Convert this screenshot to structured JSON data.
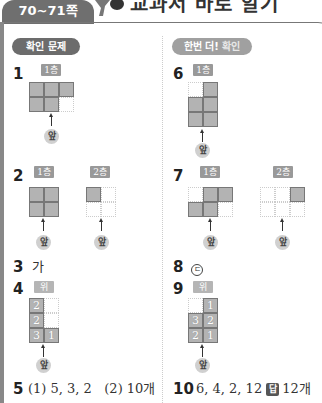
{
  "header": {
    "page_range": "70~71쪽",
    "title": "교과서 바로 알기"
  },
  "sections": {
    "left_badge": "확인 문제",
    "right_badge_main": "한번 더! ",
    "right_badge_accent": "확인"
  },
  "labels": {
    "floor1": "1층",
    "floor2": "2층",
    "top_view": "위",
    "front": "앞"
  },
  "problems": {
    "p1": {
      "num": "1",
      "floor1_grid": [
        [
          1,
          1,
          1
        ],
        [
          1,
          1,
          0
        ]
      ]
    },
    "p2": {
      "num": "2",
      "floor1_grid": [
        [
          1,
          1
        ],
        [
          1,
          1
        ]
      ],
      "floor2_grid": [
        [
          1,
          0
        ],
        [
          0,
          0
        ]
      ]
    },
    "p3": {
      "num": "3",
      "answer": "가"
    },
    "p4": {
      "num": "4",
      "top_grid": [
        [
          "2",
          ""
        ],
        [
          "2",
          ""
        ],
        [
          "3",
          "1"
        ]
      ]
    },
    "p5": {
      "num": "5",
      "answer_part1": "(1) 5, 3, 2",
      "answer_part2": "(2) 10개"
    },
    "p6": {
      "num": "6",
      "floor1_grid": [
        [
          0,
          1
        ],
        [
          1,
          1
        ],
        [
          1,
          1
        ]
      ]
    },
    "p7": {
      "num": "7",
      "floor1_grid": [
        [
          0,
          1,
          1
        ],
        [
          1,
          1,
          0
        ]
      ],
      "floor2_grid": [
        [
          0,
          0,
          1
        ],
        [
          0,
          0,
          0
        ]
      ]
    },
    "p8": {
      "num": "8",
      "answer": "ㄷ"
    },
    "p9": {
      "num": "9",
      "top_grid": [
        [
          "",
          "1"
        ],
        [
          "3",
          "2"
        ],
        [
          "2",
          "1"
        ]
      ]
    },
    "p10": {
      "num": "10",
      "answer_work": "6, 4, 2, 12",
      "answer_icon": "답",
      "answer_final": "12개"
    }
  },
  "colors": {
    "tab_bg": "#6f6f6f",
    "filled_cell": "#b3b3b3",
    "badge_left": "#6c6c6c",
    "badge_right": "#a0a0a0"
  }
}
